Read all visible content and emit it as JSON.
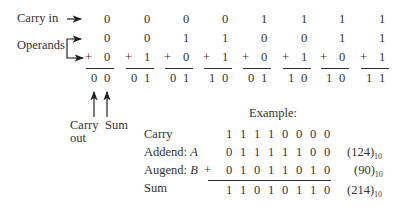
{
  "labels": {
    "carry_in": "Carry in",
    "operands": "Operands",
    "carry_out_line1": "Carry",
    "carry_out_line2": "out",
    "sum": "Sum",
    "plus": "+"
  },
  "columns": [
    {
      "carry_in": "0",
      "a": "0",
      "b": "0",
      "result": [
        "0",
        "0"
      ]
    },
    {
      "carry_in": "0",
      "a": "0",
      "b": "1",
      "result": [
        "0",
        "1"
      ]
    },
    {
      "carry_in": "0",
      "a": "1",
      "b": "0",
      "result": [
        "0",
        "1"
      ]
    },
    {
      "carry_in": "0",
      "a": "1",
      "b": "1",
      "result": [
        "1",
        "0"
      ]
    },
    {
      "carry_in": "1",
      "a": "0",
      "b": "0",
      "result": [
        "0",
        "1"
      ]
    },
    {
      "carry_in": "1",
      "a": "0",
      "b": "1",
      "result": [
        "1",
        "0"
      ]
    },
    {
      "carry_in": "1",
      "a": "1",
      "b": "0",
      "result": [
        "1",
        "0"
      ]
    },
    {
      "carry_in": "1",
      "a": "1",
      "b": "1",
      "result": [
        "1",
        "1"
      ]
    }
  ],
  "example": {
    "title": "Example:",
    "rows": {
      "carry": {
        "label": "Carry",
        "bits": [
          "1",
          "1",
          "1",
          "1",
          "0",
          "0",
          "0",
          "0"
        ]
      },
      "addend": {
        "label": "Addend: ",
        "var": "A",
        "bits": [
          "0",
          "1",
          "1",
          "1",
          "1",
          "1",
          "0",
          "0"
        ],
        "decimal": "(124)",
        "base": "10"
      },
      "augend": {
        "label": "Augend: ",
        "var": "B",
        "bits": [
          "0",
          "1",
          "0",
          "1",
          "1",
          "0",
          "1",
          "0"
        ],
        "decimal": "(90)",
        "base": "10"
      },
      "sum": {
        "label": "Sum",
        "bits": [
          "1",
          "1",
          "0",
          "1",
          "0",
          "1",
          "1",
          "0"
        ],
        "decimal": "(214)",
        "base": "10"
      }
    },
    "plus": "+"
  }
}
